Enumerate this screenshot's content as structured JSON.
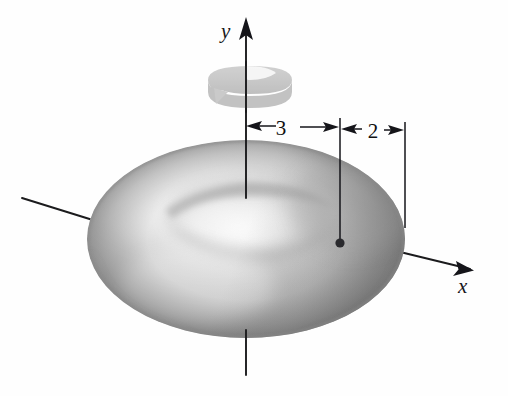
{
  "figure": {
    "background_color": "#fefefe",
    "ink_color": "#18181a",
    "axes": [
      {
        "name": "y-axis",
        "label": "y",
        "orientation": "vertical",
        "has_arrowhead": true,
        "hidden_segment": "dashed where it passes behind the torus"
      },
      {
        "name": "x-axis",
        "label": "x",
        "orientation": "down-right",
        "has_arrowhead": true,
        "hidden_segment": "dashed where it passes behind the torus"
      },
      {
        "name": "z-axis",
        "label": "",
        "orientation": "up-left",
        "has_arrowhead": false,
        "hidden_segment": "dashed where it passes behind the torus"
      }
    ],
    "dimensions": [
      {
        "name": "major-radius",
        "label": "3",
        "from": "y-axis (center of torus)",
        "to": "center of the circular cross-section",
        "arrow_style": "double-headed"
      },
      {
        "name": "minor-radius",
        "label": "2",
        "from": "center of the circular cross-section",
        "to": "outer edge of the torus",
        "arrow_style": "double-headed"
      }
    ],
    "rotation_arrow": {
      "name": "rotation-arrow",
      "description": "curved ribbon arrow encircling the y-axis indicating revolution",
      "color": "#c3c3c3"
    },
    "center_dot": {
      "name": "cross-section-center-dot",
      "color": "#2a2a2e"
    },
    "surface": {
      "name": "torus-surface",
      "shading": "airbrushed grayscale, highlight upper-left, shadow lower-right",
      "highlight_color": "#fdfdfd",
      "midtone_color": "#b4b4b4",
      "shadow_color": "#8b8b8b"
    }
  }
}
